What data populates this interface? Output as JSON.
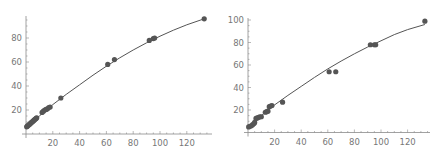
{
  "chart_data": [
    {
      "type": "scatter",
      "title": "",
      "xlabel": "",
      "ylabel": "",
      "xlim": [
        0,
        135
      ],
      "ylim": [
        0,
        98
      ],
      "x_ticks": [
        20,
        40,
        60,
        80,
        100,
        120
      ],
      "y_ticks": [
        20,
        40,
        60,
        80
      ],
      "grid": false,
      "legend": null,
      "series": [
        {
          "name": "data",
          "kind": "points",
          "x": [
            0.5,
            1,
            1.5,
            2,
            2.5,
            3,
            3.5,
            4,
            4.5,
            5,
            5.5,
            6,
            6.5,
            7,
            7.5,
            8,
            12,
            13,
            14,
            15,
            16,
            17,
            18,
            26,
            61,
            66,
            92,
            95,
            96,
            133
          ],
          "y": [
            6,
            6.5,
            7,
            7.5,
            8,
            8.5,
            9,
            9.5,
            10,
            10.5,
            11,
            11.5,
            12,
            12.5,
            13,
            13.5,
            18,
            19,
            20,
            20.5,
            21,
            22,
            22.5,
            30,
            58,
            62,
            78,
            79.5,
            80,
            96
          ]
        },
        {
          "name": "fit",
          "kind": "line",
          "x": [
            0,
            10,
            20,
            30,
            40,
            50,
            60,
            70,
            80,
            90,
            100,
            110,
            120,
            133
          ],
          "y": [
            5.5,
            15,
            24.5,
            33,
            41,
            49,
            56.5,
            63.5,
            70,
            76,
            81.5,
            86.5,
            91,
            96
          ]
        }
      ]
    },
    {
      "type": "scatter",
      "title": "",
      "xlabel": "",
      "ylabel": "",
      "xlim": [
        0,
        135
      ],
      "ylim": [
        0,
        102
      ],
      "x_ticks": [
        20,
        40,
        60,
        80,
        100,
        120
      ],
      "y_ticks": [
        20,
        40,
        60,
        80,
        100
      ],
      "grid": false,
      "legend": null,
      "series": [
        {
          "name": "data",
          "kind": "points",
          "x": [
            0.5,
            1.5,
            2.5,
            3.5,
            4.5,
            5,
            6,
            7,
            8,
            9,
            10,
            13,
            14,
            15,
            16,
            17,
            18,
            26,
            61,
            66,
            92,
            95,
            96,
            133
          ],
          "y": [
            5,
            5.5,
            6,
            7,
            8,
            9,
            12.5,
            13,
            13.5,
            14,
            14,
            18,
            18.5,
            19,
            23,
            23.5,
            24,
            27,
            54,
            54,
            78,
            78,
            78,
            99
          ]
        },
        {
          "name": "fit",
          "kind": "line",
          "x": [
            0,
            10,
            20,
            30,
            40,
            50,
            60,
            70,
            80,
            90,
            100,
            110,
            120,
            133
          ],
          "y": [
            5,
            15,
            24.5,
            33,
            41,
            49,
            56.5,
            63.5,
            70,
            76,
            81.5,
            87,
            91.5,
            96
          ]
        }
      ]
    }
  ],
  "plots": [
    {
      "origin_px": [
        26,
        134
      ],
      "x_px_per_unit": 1.34,
      "y_px_per_unit": 1.2,
      "x_axis_end_px": 212,
      "y_axis_top_px": 16,
      "tick_labels_x": [
        "20",
        "40",
        "60",
        "80",
        "100",
        "120"
      ],
      "tick_labels_y": [
        "20",
        "40",
        "60",
        "80"
      ]
    },
    {
      "origin_px": [
        28,
        132.5
      ],
      "x_px_per_unit": 1.33,
      "y_px_per_unit": 1.125,
      "x_axis_end_px": 210,
      "y_axis_top_px": 18,
      "tick_labels_x": [
        "20",
        "40",
        "60",
        "80",
        "100",
        "120"
      ],
      "tick_labels_y": [
        "20",
        "40",
        "60",
        "80",
        "100"
      ]
    }
  ]
}
